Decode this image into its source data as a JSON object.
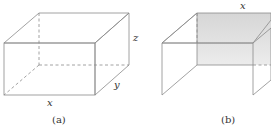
{
  "figure": {
    "panels": [
      {
        "id": "a",
        "caption": "(a)",
        "description": "closed rectangular box",
        "labels": {
          "x": "x",
          "y": "y",
          "z": "z"
        }
      },
      {
        "id": "b",
        "caption": "(b)",
        "description": "open box with top, back and two side walls (no front, no bottom)",
        "labels": {
          "x": "x"
        }
      }
    ],
    "colors": {
      "face_light": "#f2f2f2",
      "face_mid": "#e2e2e2",
      "face_dark": "#cfcfcf",
      "edge": "#8a8a8a"
    }
  }
}
